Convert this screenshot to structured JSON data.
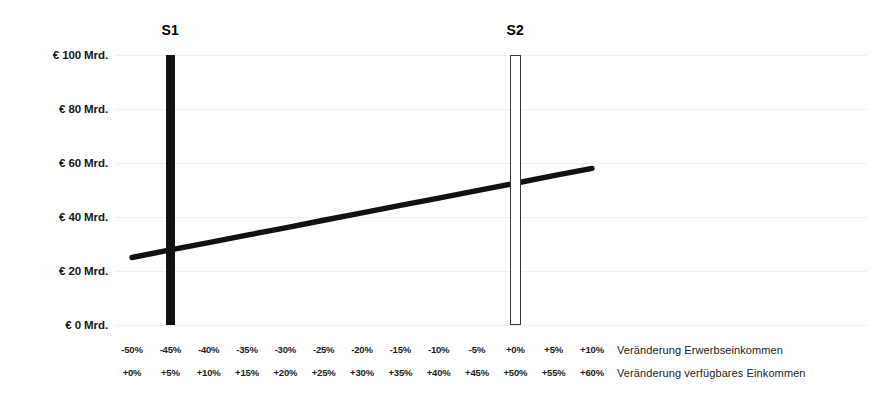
{
  "chart_data": {
    "type": "line",
    "title": "",
    "xlabel": "",
    "ylabel": "",
    "ylim": [
      0,
      100
    ],
    "y_unit": "€ Mrd.",
    "grid": true,
    "legend_position": "none",
    "y_ticks": [
      {
        "value": 100,
        "label": "€ 100 Mrd."
      },
      {
        "value": 80,
        "label": "€ 80 Mrd."
      },
      {
        "value": 60,
        "label": "€ 60 Mrd."
      },
      {
        "value": 40,
        "label": "€ 40 Mrd."
      },
      {
        "value": 20,
        "label": "€ 20 Mrd."
      },
      {
        "value": 0,
        "label": "€ 0 Mrd."
      }
    ],
    "x_axis_primary": {
      "caption": "Veränderung Erwerbseinkommen",
      "ticks": [
        "-50%",
        "-45%",
        "-40%",
        "-35%",
        "-30%",
        "-25%",
        "-20%",
        "-15%",
        "-10%",
        "-5%",
        "+0%",
        "+5%",
        "+10%"
      ],
      "values": [
        -50,
        -45,
        -40,
        -35,
        -30,
        -25,
        -20,
        -15,
        -10,
        -5,
        0,
        5,
        10
      ]
    },
    "x_axis_secondary": {
      "caption": "Veränderung verfügbares Einkommen",
      "ticks": [
        "+0%",
        "+5%",
        "+10%",
        "+15%",
        "+20%",
        "+25%",
        "+30%",
        "+35%",
        "+40%",
        "+45%",
        "+50%",
        "+55%",
        "+60%"
      ],
      "values": [
        0,
        5,
        10,
        15,
        20,
        25,
        30,
        35,
        40,
        45,
        50,
        55,
        60
      ]
    },
    "series": [
      {
        "name": "trend",
        "style": "line",
        "color": "#111111",
        "x": [
          -50,
          10
        ],
        "values": [
          25,
          58
        ],
        "points": [
          {
            "x": -50,
            "y": 25
          },
          {
            "x": -45,
            "y": 27.8
          },
          {
            "x": -40,
            "y": 30.5
          },
          {
            "x": -35,
            "y": 33.3
          },
          {
            "x": -30,
            "y": 36.0
          },
          {
            "x": -25,
            "y": 38.8
          },
          {
            "x": -20,
            "y": 41.5
          },
          {
            "x": -15,
            "y": 44.3
          },
          {
            "x": -10,
            "y": 47.0
          },
          {
            "x": -5,
            "y": 49.8
          },
          {
            "x": 0,
            "y": 52.5
          },
          {
            "x": 5,
            "y": 55.3
          },
          {
            "x": 10,
            "y": 58.0
          }
        ]
      }
    ],
    "markers": [
      {
        "name": "S1",
        "label": "S1",
        "x": -45,
        "y_top": 100,
        "y_bottom": 0,
        "fill": "solid",
        "color": "#111111"
      },
      {
        "name": "S2",
        "label": "S2",
        "x": 0,
        "y_top": 100,
        "y_bottom": 0,
        "fill": "hollow",
        "color": "#3a3a3a"
      }
    ]
  },
  "colors": {
    "background": "#ffffff",
    "ink": "#111111",
    "grid": "#f0f0f0",
    "outline": "#3a3a3a"
  }
}
